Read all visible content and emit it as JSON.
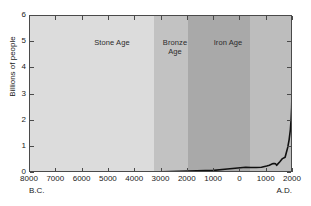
{
  "chart_data": {
    "type": "line",
    "title": "",
    "subtitle": "",
    "xlabel_left": "B.C.",
    "xlabel_right": "A.D.",
    "ylabel": "Billions of people",
    "xlim": [
      -8000,
      2000
    ],
    "ylim": [
      0,
      6
    ],
    "grid": false,
    "legend_position": "none",
    "xticks": [
      -8000,
      -7000,
      -6000,
      -5000,
      -4000,
      -3000,
      -2000,
      -1000,
      0,
      1000,
      2000
    ],
    "xticklabels": [
      "8000",
      "7000",
      "6000",
      "5000",
      "4000",
      "3000",
      "2000",
      "1000",
      "0",
      "1000",
      "2000"
    ],
    "yticks": [
      0,
      1,
      2,
      3,
      4,
      5,
      6
    ],
    "yticklabels": [
      "0",
      "1",
      "2",
      "3",
      "4",
      "5",
      "6"
    ],
    "series": [
      {
        "name": "World population",
        "x": [
          -8000,
          -7000,
          -6000,
          -5000,
          -4000,
          -3000,
          -2000,
          -1000,
          -500,
          0,
          200,
          400,
          600,
          800,
          1000,
          1100,
          1200,
          1250,
          1300,
          1340,
          1380,
          1400,
          1500,
          1600,
          1700,
          1750,
          1800,
          1850,
          1900,
          1930,
          1950,
          1960,
          1970,
          1980,
          1990,
          2000
        ],
        "y": [
          0.005,
          0.01,
          0.02,
          0.03,
          0.04,
          0.05,
          0.07,
          0.1,
          0.15,
          0.2,
          0.22,
          0.21,
          0.21,
          0.22,
          0.27,
          0.3,
          0.34,
          0.36,
          0.36,
          0.35,
          0.29,
          0.32,
          0.43,
          0.55,
          0.6,
          0.79,
          0.98,
          1.26,
          1.65,
          2.07,
          2.52,
          3.02,
          3.7,
          4.44,
          5.27,
          6.08
        ]
      }
    ],
    "regions": [
      {
        "name": "Stone Age",
        "label": "Stone Age",
        "x_start": -8000,
        "x_end": -3300,
        "color": "#dcdcdc"
      },
      {
        "name": "Bronze Age",
        "label": "Bronze\nAge",
        "x_start": -3300,
        "x_end": -2000,
        "color": "#c2c2c2"
      },
      {
        "name": "Iron Age",
        "label": "Iron Age",
        "x_start": -2000,
        "x_end": 350,
        "color": "#a9a9a9"
      },
      {
        "name": "Modern",
        "label": "",
        "x_start": 350,
        "x_end": 2000,
        "color": "#bdbdbd"
      }
    ],
    "annotations": [
      {
        "name": "black-death",
        "text": "Black Death",
        "x": 1350,
        "y": 0.3
      }
    ],
    "curve_color": "#111111",
    "axis_color": "#4a4a4a"
  }
}
